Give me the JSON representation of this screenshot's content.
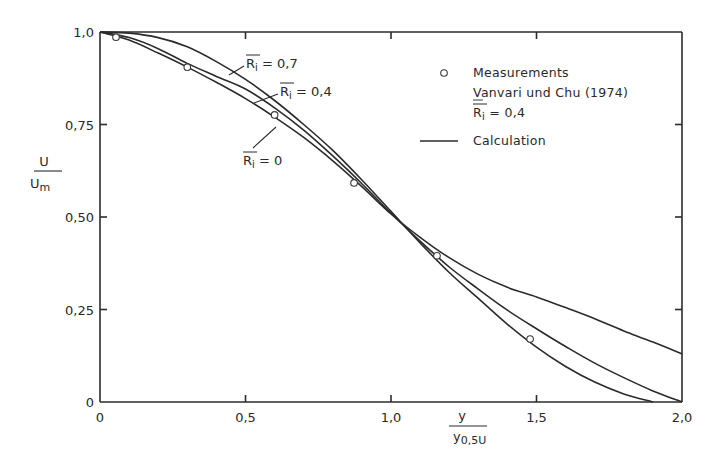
{
  "chart_data": {
    "type": "line",
    "title": "",
    "xlabel": {
      "numerator": "y",
      "denominator_main": "y",
      "denominator_sub": "0,5U"
    },
    "ylabel": {
      "numerator": "U",
      "denominator_main": "U",
      "denominator_sub": "m"
    },
    "xlim": [
      0,
      2.0
    ],
    "ylim": [
      0,
      1.0
    ],
    "grid": false,
    "x_ticks": [
      {
        "value": 0,
        "label": "0"
      },
      {
        "value": 0.5,
        "label": "0,5"
      },
      {
        "value": 1.0,
        "label": "1,0"
      },
      {
        "value": 1.5,
        "label": "1,5"
      },
      {
        "value": 2.0,
        "label": "2,0"
      }
    ],
    "y_ticks": [
      {
        "value": 0,
        "label": "0"
      },
      {
        "value": 0.25,
        "label": "0,25"
      },
      {
        "value": 0.5,
        "label": "0,50"
      },
      {
        "value": 0.75,
        "label": "0,75"
      },
      {
        "value": 1.0,
        "label": "1,0"
      }
    ],
    "series": [
      {
        "name": "Calculation Ri = 0,7",
        "label": {
          "prefix": "R",
          "sub": "i",
          "value": " = 0,7"
        },
        "style": "line",
        "x": [
          0,
          0.1,
          0.2,
          0.3,
          0.4,
          0.5,
          0.6,
          0.7,
          0.8,
          0.9,
          1.0,
          1.1,
          1.2,
          1.3,
          1.4,
          1.5,
          1.6,
          1.7,
          1.8,
          1.9
        ],
        "y": [
          1.0,
          0.997,
          0.985,
          0.96,
          0.92,
          0.872,
          0.815,
          0.75,
          0.68,
          0.6,
          0.515,
          0.43,
          0.35,
          0.28,
          0.21,
          0.148,
          0.096,
          0.054,
          0.022,
          0.0
        ]
      },
      {
        "name": "Calculation Ri = 0,4",
        "label": {
          "prefix": "R",
          "sub": "i",
          "value": " = 0,4"
        },
        "style": "line",
        "x": [
          0,
          0.1,
          0.2,
          0.3,
          0.4,
          0.5,
          0.6,
          0.7,
          0.8,
          0.9,
          1.0,
          1.1,
          1.2,
          1.3,
          1.4,
          1.5,
          1.6,
          1.7,
          1.8,
          1.9,
          2.0
        ],
        "y": [
          1.0,
          0.985,
          0.955,
          0.915,
          0.88,
          0.846,
          0.795,
          0.735,
          0.665,
          0.59,
          0.51,
          0.435,
          0.365,
          0.305,
          0.248,
          0.198,
          0.15,
          0.105,
          0.066,
          0.03,
          0.0
        ]
      },
      {
        "name": "Calculation Ri = 0",
        "label": {
          "prefix": "R",
          "sub": "i",
          "value": " = 0"
        },
        "style": "line",
        "x": [
          0,
          0.1,
          0.2,
          0.3,
          0.4,
          0.5,
          0.6,
          0.7,
          0.8,
          0.9,
          1.0,
          1.1,
          1.2,
          1.3,
          1.4,
          1.5,
          1.6,
          1.7,
          1.8,
          1.9,
          2.0
        ],
        "y": [
          1.0,
          0.978,
          0.943,
          0.905,
          0.864,
          0.82,
          0.77,
          0.715,
          0.652,
          0.582,
          0.508,
          0.445,
          0.39,
          0.345,
          0.31,
          0.284,
          0.255,
          0.225,
          0.192,
          0.162,
          0.13
        ]
      },
      {
        "name": "Measurements Vanvari und Chu (1974) Ri = 0,4",
        "style": "marker-open-circle",
        "x": [
          0.055,
          0.3,
          0.6,
          0.873,
          1.158,
          1.478
        ],
        "y": [
          0.986,
          0.905,
          0.776,
          0.592,
          0.395,
          0.17
        ]
      }
    ],
    "legend": {
      "position": "upper right (inside)",
      "entries": [
        {
          "symbol": "open-circle",
          "lines": [
            "Measurements",
            "Vanvari und Chu (1974)",
            "Ri = 0,4"
          ]
        },
        {
          "symbol": "solid-line",
          "lines": [
            "Calculation"
          ]
        }
      ]
    },
    "annotations": [
      {
        "text": "Ri = 0,7",
        "points_to": "upper curve"
      },
      {
        "text": "Ri = 0,4",
        "points_to": "middle curve"
      },
      {
        "text": "Ri = 0",
        "points_to": "lower curve"
      }
    ]
  },
  "legend": {
    "measurements_label": "Measurements",
    "source_label": "Vanvari und Chu (1974)",
    "ri_prefix": "R",
    "ri_sub": "i",
    "ri_value": " = 0,4",
    "calculation_label": "Calculation"
  },
  "axes": {
    "y_num": "U",
    "y_den": "U",
    "y_den_sub": "m",
    "x_num": "y",
    "x_den": "y",
    "x_den_sub": "0,5U"
  }
}
